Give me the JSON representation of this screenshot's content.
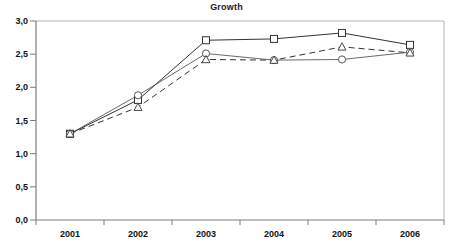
{
  "chart_data": {
    "type": "line",
    "title": "Growth",
    "xlabel": "",
    "ylabel": "",
    "categories": [
      "2001",
      "2002",
      "2003",
      "2004",
      "2005",
      "2006"
    ],
    "ylim": [
      0.0,
      3.0
    ],
    "ytick_labels": [
      "0,0",
      "0,5",
      "1,0",
      "1,5",
      "2,0",
      "2,5",
      "3,0"
    ],
    "ytick_values": [
      0.0,
      0.5,
      1.0,
      1.5,
      2.0,
      2.5,
      3.0
    ],
    "grid": false,
    "legend": "none",
    "decimal_separator": ",",
    "series": [
      {
        "name": "series-square",
        "marker": "square",
        "line_style": "solid",
        "color": "#333333",
        "values": [
          1.3,
          1.81,
          2.71,
          2.73,
          2.82,
          2.64
        ]
      },
      {
        "name": "series-circle",
        "marker": "circle",
        "line_style": "solid",
        "color": "#444444",
        "values": [
          1.3,
          1.88,
          2.51,
          2.41,
          2.42,
          2.53
        ]
      },
      {
        "name": "series-triangle",
        "marker": "triangle",
        "line_style": "dashed",
        "color": "#333333",
        "values": [
          1.3,
          1.7,
          2.42,
          2.41,
          2.61,
          2.52
        ]
      }
    ]
  },
  "axes": {
    "axis_color": "#888888",
    "border_color": "#aaaaaa"
  }
}
